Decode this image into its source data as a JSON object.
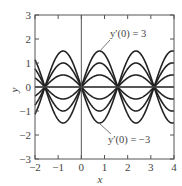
{
  "chart_data": {
    "type": "line",
    "title": "",
    "xlabel": "x",
    "ylabel": "y",
    "xlim": [
      -2,
      4
    ],
    "ylim": [
      -3,
      3
    ],
    "xticks": [
      -2,
      -1,
      0,
      1,
      2,
      3,
      4
    ],
    "yticks": [
      -3,
      -2,
      -1,
      0,
      1,
      2,
      3
    ],
    "xtick_labels": [
      "−2",
      "−1",
      "0",
      "1",
      "2",
      "3",
      "4"
    ],
    "ytick_labels": [
      "−3",
      "−2",
      "−1",
      "0",
      "1",
      "2",
      "3"
    ],
    "grid": false,
    "legend": null,
    "function": "y = (y'(0)/2) · sin(2x)",
    "series": [
      {
        "name": "y'(0) = 3",
        "amplitude": 1.5
      },
      {
        "name": "y'(0) = 2",
        "amplitude": 1.0
      },
      {
        "name": "y'(0) = 1",
        "amplitude": 0.5
      },
      {
        "name": "y'(0) = 0",
        "amplitude": 0.0
      },
      {
        "name": "y'(0) = -1",
        "amplitude": -0.5
      },
      {
        "name": "y'(0) = -2",
        "amplitude": -1.0
      },
      {
        "name": "y'(0) = -3",
        "amplitude": -1.5
      }
    ],
    "annotations": [
      {
        "text": "y′(0) = 3",
        "points_to_series": "y'(0) = 3"
      },
      {
        "text": "y′(0) = −3",
        "points_to_series": "y'(0) = -3"
      }
    ]
  },
  "labels": {
    "xlabel": "x",
    "ylabel": "y",
    "annot_top": "y′(0) = 3",
    "annot_bottom": "y′(0) = −3"
  },
  "colors": {
    "curve": "#222222",
    "axis": "#555555",
    "text": "#444444"
  }
}
